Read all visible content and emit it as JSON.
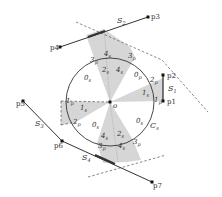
{
  "colors": {
    "background": "#ffffff",
    "shade": "#d4d4d4",
    "line": "#333333",
    "dashed": "#555555"
  },
  "circle": {
    "label": "C",
    "label_sub": "s",
    "center_label": "o",
    "center_label_sub": ""
  },
  "points": {
    "p1": "p1",
    "p2": "p2",
    "p3": "p3",
    "p4": "p4",
    "p5": "p5",
    "p6": "p6",
    "p7": "p7"
  },
  "segments": {
    "s1": {
      "main": "S",
      "sub": "1"
    },
    "s2": {
      "main": "S",
      "sub": "2"
    },
    "s3": {
      "main": "S",
      "sub": "3"
    },
    "s4": {
      "main": "S",
      "sub": "4"
    }
  },
  "sector_labels": {
    "top_2s": {
      "main": "2",
      "sub": "s"
    },
    "top_4s": {
      "main": "4",
      "sub": "s"
    },
    "top_4s_outer": {
      "main": "4",
      "sub": "s"
    },
    "top_3p_left": {
      "main": "3",
      "sub": "p"
    },
    "top_3p_right": {
      "main": "3",
      "sub": "p"
    },
    "upper_left_0s": {
      "main": "0",
      "sub": "s"
    },
    "upper_right_0p": {
      "main": "0",
      "sub": "p"
    },
    "right_1s": {
      "main": "1",
      "sub": "s"
    },
    "right_2p": {
      "main": "2",
      "sub": "p"
    },
    "right_1p": {
      "main": "1",
      "sub": "p"
    },
    "left_1p": {
      "main": "1",
      "sub": "p"
    },
    "left_1s": {
      "main": "1",
      "sub": "s"
    },
    "left_2p": {
      "main": "2",
      "sub": "p"
    },
    "lower_left_0s": {
      "main": "0",
      "sub": "s"
    },
    "lower_right_0s": {
      "main": "0",
      "sub": "s"
    },
    "bottom_4s": {
      "main": "4",
      "sub": "s"
    },
    "bottom_2s": {
      "main": "2",
      "sub": "s"
    },
    "bottom_4s_outer": {
      "main": "4",
      "sub": "s"
    },
    "bottom_3p_left": {
      "main": "3",
      "sub": "p"
    },
    "bottom_3p_right": {
      "main": "3",
      "sub": "p"
    }
  }
}
